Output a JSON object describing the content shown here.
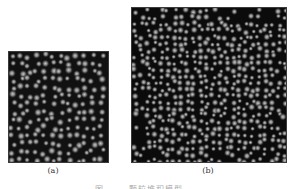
{
  "figure": {
    "panels": [
      {
        "id": "a",
        "label": "(a)",
        "description": "dense particle packing, square region",
        "particle_color": "#8c8c8c",
        "background": "#111111"
      },
      {
        "id": "b",
        "label": "(b)",
        "description": "larger particle packing with sparse edges",
        "particle_color": "#8c8c8c",
        "background": "#0b0b0b"
      }
    ],
    "caption": "图 —— 颗粒堆积模型"
  }
}
